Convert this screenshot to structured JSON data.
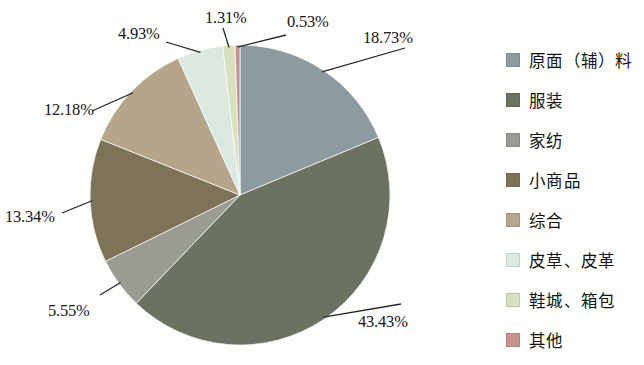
{
  "chart_data": {
    "type": "pie",
    "title": "",
    "subtitle": "",
    "xlabel": "",
    "ylabel": "",
    "legend_position": "right",
    "grid": false,
    "start_angle_deg": 0,
    "direction": "clockwise",
    "units": "percent",
    "categories": [
      "原面（辅）料",
      "服装",
      "家纺",
      "小商品",
      "综合",
      "皮草、皮革",
      "鞋城、箱包",
      "其他"
    ],
    "values": [
      18.73,
      43.43,
      5.55,
      13.34,
      12.18,
      4.93,
      1.31,
      0.53
    ],
    "labels": [
      "18.73%",
      "43.43%",
      "5.55%",
      "13.34%",
      "12.18%",
      "4.93%",
      "1.31%",
      "0.53%"
    ],
    "colors": [
      "#8d9aa0",
      "#6b7260",
      "#9b9b94",
      "#7d7358",
      "#b5a68b",
      "#dde8e1",
      "#d7e0bf",
      "#c6948f"
    ],
    "slices": [
      {
        "name": "原面（辅）料",
        "value": 18.73,
        "label": "18.73%",
        "color": "#8d9aa0"
      },
      {
        "name": "服装",
        "value": 43.43,
        "label": "43.43%",
        "color": "#6b7260"
      },
      {
        "name": "家纺",
        "value": 5.55,
        "label": "5.55%",
        "color": "#9b9b94"
      },
      {
        "name": "小商品",
        "value": 13.34,
        "label": "13.34%",
        "color": "#7d7358"
      },
      {
        "name": "综合",
        "value": 12.18,
        "label": "12.18%",
        "color": "#b5a68b"
      },
      {
        "name": "皮草、皮革",
        "value": 4.93,
        "label": "4.93%",
        "color": "#dde8e1"
      },
      {
        "name": "鞋城、箱包",
        "value": 1.31,
        "label": "1.31%",
        "color": "#d7e0bf"
      },
      {
        "name": "其他",
        "value": 0.53,
        "label": "0.53%",
        "color": "#c6948f"
      }
    ]
  },
  "legend": {
    "items": [
      {
        "label": "原面（辅）料",
        "color": "#8d9aa0"
      },
      {
        "label": "服装",
        "color": "#6b7260"
      },
      {
        "label": "家纺",
        "color": "#9b9b94"
      },
      {
        "label": "小商品",
        "color": "#7d7358"
      },
      {
        "label": "综合",
        "color": "#b5a68b"
      },
      {
        "label": "皮草、皮革",
        "color": "#dde8e1"
      },
      {
        "label": "鞋城、箱包",
        "color": "#d7e0bf"
      },
      {
        "label": "其他",
        "color": "#c6948f"
      }
    ]
  },
  "callouts": [
    {
      "text": "18.73%",
      "x": 363,
      "y": 28
    },
    {
      "text": "43.43%",
      "x": 358,
      "y": 312
    },
    {
      "text": "5.55%",
      "x": 48,
      "y": 301
    },
    {
      "text": "13.34%",
      "x": 5,
      "y": 207
    },
    {
      "text": "12.18%",
      "x": 44,
      "y": 100
    },
    {
      "text": "4.93%",
      "x": 118,
      "y": 24
    },
    {
      "text": "1.31%",
      "x": 205,
      "y": 8
    },
    {
      "text": "0.53%",
      "x": 287,
      "y": 12
    }
  ]
}
